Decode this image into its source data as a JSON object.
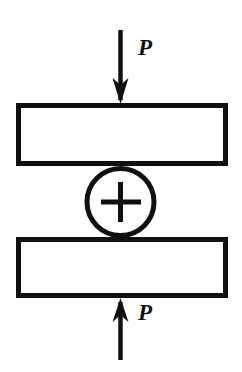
{
  "figure": {
    "kind": "engineering-line-drawing",
    "caption": "",
    "background_color": "#ffffff",
    "ink_color": "#101010",
    "canvas": {
      "width": 242,
      "height": 372
    }
  },
  "labels": {
    "top_load": "P",
    "bottom_load": "P"
  },
  "elements": {
    "top_arrow": {
      "name": "top-load-arrow",
      "direction": "down",
      "line_x": 120,
      "line_y_start": 30,
      "line_y_end": 103,
      "head_tip_y": 103
    },
    "top_plate": {
      "name": "upper-plate",
      "x": 16,
      "y": 103,
      "width": 212,
      "height": 63,
      "fill": "#ffffff",
      "stroke": "#101010",
      "stroke_width": 5
    },
    "joint_circle": {
      "name": "pin-joint-circle",
      "cx": 120,
      "cy": 202,
      "r": 34,
      "marker": "plus",
      "fill": "#ffffff",
      "stroke": "#101010",
      "stroke_width": 5
    },
    "bottom_plate": {
      "name": "lower-plate",
      "x": 16,
      "y": 237,
      "width": 212,
      "height": 61,
      "fill": "#ffffff",
      "stroke": "#101010",
      "stroke_width": 5
    },
    "bottom_arrow": {
      "name": "bottom-load-arrow",
      "direction": "up",
      "line_x": 120,
      "line_y_start": 360,
      "line_y_end": 298,
      "head_tip_y": 298
    }
  }
}
